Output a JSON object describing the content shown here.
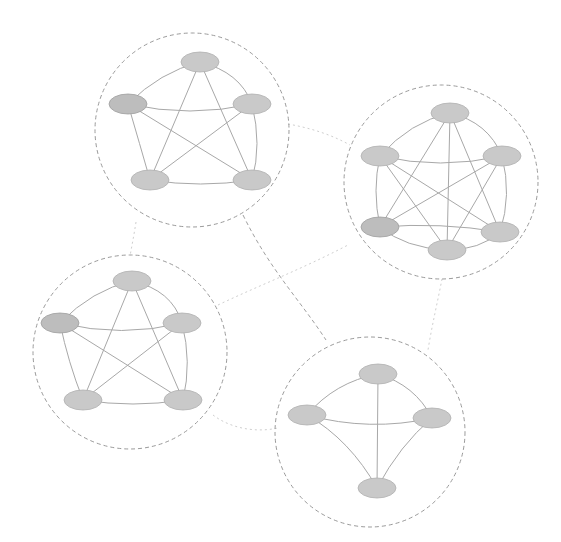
{
  "diagram": {
    "type": "community-graph",
    "colors": {
      "background": "#ffffff",
      "node_fill": "#c9c9c9",
      "node_stroke": "#b0b0b0",
      "edge": "#a8a8a8",
      "community_border": "#9a9a9a",
      "inter_link_strong": "#a0a0a0",
      "inter_link_weak": "#cfcfcf"
    },
    "communities": [
      {
        "id": "top-left",
        "center": [
          192,
          130
        ],
        "radius": 97,
        "nodes": [
          [
            200,
            62
          ],
          [
            128,
            104
          ],
          [
            252,
            104
          ],
          [
            150,
            180
          ],
          [
            252,
            180
          ]
        ],
        "clique": "K5"
      },
      {
        "id": "right",
        "center": [
          441,
          182
        ],
        "radius": 97,
        "nodes": [
          [
            450,
            113
          ],
          [
            380,
            156
          ],
          [
            502,
            156
          ],
          [
            380,
            227
          ],
          [
            500,
            232
          ],
          [
            447,
            250
          ]
        ],
        "clique": "K6"
      },
      {
        "id": "bottom-left",
        "center": [
          130,
          352
        ],
        "radius": 97,
        "nodes": [
          [
            132,
            281
          ],
          [
            60,
            323
          ],
          [
            182,
            323
          ],
          [
            83,
            400
          ],
          [
            183,
            400
          ]
        ],
        "clique": "K5"
      },
      {
        "id": "bottom-right",
        "center": [
          370,
          432
        ],
        "radius": 95,
        "nodes": [
          [
            378,
            374
          ],
          [
            307,
            415
          ],
          [
            432,
            418
          ],
          [
            377,
            488
          ]
        ],
        "clique": "K4"
      }
    ],
    "inter_links": [
      {
        "from": "top-left",
        "to": "bottom-right",
        "style": "strong"
      },
      {
        "from": "bottom-left",
        "to": "right",
        "style": "weak"
      },
      {
        "from": "top-left",
        "to": "right",
        "style": "weak"
      },
      {
        "from": "top-left",
        "to": "bottom-left",
        "style": "weak"
      },
      {
        "from": "right",
        "to": "bottom-right",
        "style": "weak"
      },
      {
        "from": "bottom-left",
        "to": "bottom-right",
        "style": "weak"
      }
    ]
  }
}
